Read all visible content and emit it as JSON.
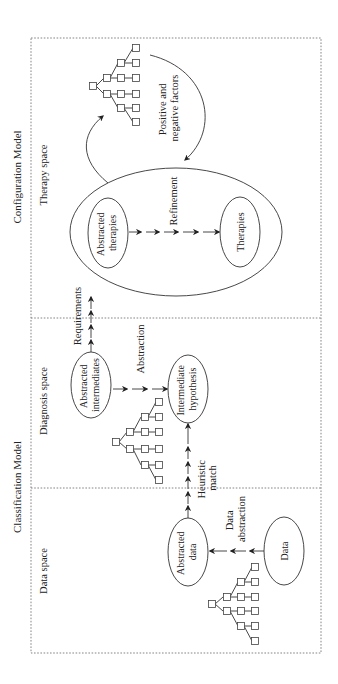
{
  "diagram": {
    "models": {
      "configuration": "Configuration Model",
      "classification": "Classification Model"
    },
    "spaces": {
      "therapy": "Therapy space",
      "diagnosis": "Diagnosis space",
      "data": "Data space"
    },
    "nodes": {
      "abstracted_therapies": [
        "Abstracted",
        "therapies"
      ],
      "therapies": "Therapies",
      "abstracted_intermediates": [
        "Abstracted",
        "intermediates"
      ],
      "intermediate_hypothesis": [
        "Intermediate",
        "hypothesis"
      ],
      "abstracted_data": [
        "Abstracted",
        "data"
      ],
      "data": "Data"
    },
    "edges": {
      "refinement": "Refinement",
      "requirements": "Requirements",
      "abstraction": "Abstraction",
      "heuristic_match": [
        "Heuristic",
        "match"
      ],
      "data_abstraction": [
        "Data",
        "abstraction"
      ],
      "feedback": [
        "Positive and",
        "negative factors"
      ]
    },
    "colors": {
      "line": "#333333",
      "dashed_border": "#777777",
      "background": "#ffffff"
    }
  }
}
